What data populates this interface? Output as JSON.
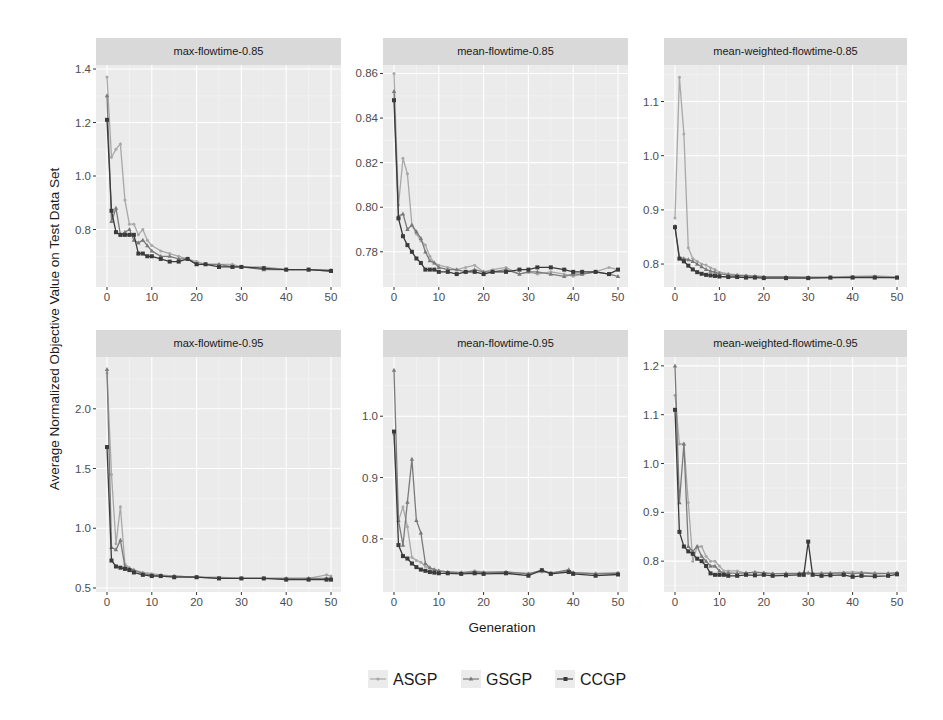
{
  "figure": {
    "ylabel": "Average Normalized Objective Value on Test Data Set",
    "xlabel": "Generation"
  },
  "legend": {
    "items": [
      {
        "label": "ASGP",
        "color": "#a8a8a8",
        "marker": "dot"
      },
      {
        "label": "GSGP",
        "color": "#7a7a7a",
        "marker": "triangle"
      },
      {
        "label": "CCGP",
        "color": "#3a3a3a",
        "marker": "square"
      }
    ]
  },
  "chart_data": [
    {
      "type": "line",
      "title": "max-flowtime-0.85",
      "xlabel": "Generation",
      "ylabel": "Average Normalized Objective Value on Test Data Set",
      "xlim": [
        0,
        50
      ],
      "ylim": [
        0.6,
        1.4
      ],
      "xticks": [
        0,
        10,
        20,
        30,
        40,
        50
      ],
      "yticks": [
        0.8,
        1.0,
        1.2,
        1.4
      ],
      "grid": true,
      "legend_position": "bottom",
      "x": [
        0,
        1,
        2,
        3,
        4,
        5,
        6,
        7,
        8,
        9,
        10,
        12,
        14,
        16,
        18,
        20,
        22,
        25,
        28,
        30,
        35,
        40,
        45,
        50
      ],
      "series": [
        {
          "name": "ASGP",
          "values": [
            1.37,
            1.07,
            1.1,
            1.12,
            0.91,
            0.82,
            0.82,
            0.78,
            0.8,
            0.76,
            0.74,
            0.72,
            0.71,
            0.7,
            0.69,
            0.68,
            0.67,
            0.67,
            0.67,
            0.66,
            0.66,
            0.65,
            0.65,
            0.65
          ]
        },
        {
          "name": "GSGP",
          "values": [
            1.3,
            0.83,
            0.88,
            0.78,
            0.79,
            0.8,
            0.76,
            0.75,
            0.76,
            0.74,
            0.72,
            0.7,
            0.7,
            0.69,
            0.69,
            0.67,
            0.67,
            0.67,
            0.66,
            0.66,
            0.65,
            0.65,
            0.65,
            0.645
          ]
        },
        {
          "name": "CCGP",
          "values": [
            1.21,
            0.87,
            0.79,
            0.78,
            0.78,
            0.78,
            0.78,
            0.71,
            0.71,
            0.7,
            0.7,
            0.69,
            0.68,
            0.68,
            0.69,
            0.67,
            0.67,
            0.66,
            0.66,
            0.66,
            0.655,
            0.65,
            0.65,
            0.645
          ]
        }
      ]
    },
    {
      "type": "line",
      "title": "mean-flowtime-0.85",
      "xlabel": "Generation",
      "ylabel": "Average Normalized Objective Value on Test Data Set",
      "xlim": [
        0,
        50
      ],
      "ylim": [
        0.766,
        0.862
      ],
      "xticks": [
        0,
        10,
        20,
        30,
        40,
        50
      ],
      "yticks": [
        0.78,
        0.8,
        0.82,
        0.84,
        0.86
      ],
      "grid": true,
      "legend_position": "bottom",
      "x": [
        0,
        1,
        2,
        3,
        4,
        5,
        6,
        7,
        8,
        9,
        10,
        12,
        14,
        16,
        18,
        20,
        22,
        25,
        28,
        30,
        32,
        35,
        38,
        40,
        42,
        45,
        48,
        50
      ],
      "series": [
        {
          "name": "ASGP",
          "values": [
            0.86,
            0.801,
            0.822,
            0.815,
            0.792,
            0.788,
            0.785,
            0.783,
            0.778,
            0.775,
            0.774,
            0.773,
            0.772,
            0.773,
            0.774,
            0.771,
            0.772,
            0.773,
            0.77,
            0.771,
            0.77,
            0.771,
            0.77,
            0.769,
            0.77,
            0.771,
            0.773,
            0.772
          ]
        },
        {
          "name": "GSGP",
          "values": [
            0.852,
            0.796,
            0.797,
            0.79,
            0.792,
            0.789,
            0.786,
            0.78,
            0.776,
            0.775,
            0.773,
            0.772,
            0.772,
            0.771,
            0.772,
            0.771,
            0.771,
            0.772,
            0.77,
            0.771,
            0.771,
            0.77,
            0.769,
            0.77,
            0.77,
            0.771,
            0.77,
            0.769
          ]
        },
        {
          "name": "CCGP",
          "values": [
            0.848,
            0.795,
            0.787,
            0.783,
            0.78,
            0.777,
            0.775,
            0.772,
            0.772,
            0.772,
            0.771,
            0.771,
            0.77,
            0.771,
            0.771,
            0.77,
            0.771,
            0.771,
            0.772,
            0.772,
            0.773,
            0.773,
            0.772,
            0.771,
            0.771,
            0.771,
            0.77,
            0.772
          ]
        }
      ]
    },
    {
      "type": "line",
      "title": "mean-weighted-flowtime-0.85",
      "xlabel": "Generation",
      "ylabel": "Average Normalized Objective Value on Test Data Set",
      "xlim": [
        0,
        50
      ],
      "ylim": [
        0.765,
        1.16
      ],
      "xticks": [
        0,
        10,
        20,
        30,
        40,
        50
      ],
      "yticks": [
        0.8,
        0.9,
        1.0,
        1.1
      ],
      "grid": true,
      "legend_position": "bottom",
      "x": [
        0,
        1,
        2,
        3,
        4,
        5,
        6,
        7,
        8,
        9,
        10,
        12,
        14,
        16,
        18,
        20,
        25,
        30,
        35,
        40,
        45,
        50
      ],
      "series": [
        {
          "name": "ASGP",
          "values": [
            0.885,
            1.145,
            1.04,
            0.83,
            0.81,
            0.805,
            0.8,
            0.798,
            0.793,
            0.79,
            0.785,
            0.782,
            0.78,
            0.779,
            0.778,
            0.777,
            0.776,
            0.776,
            0.776,
            0.777,
            0.778,
            0.776
          ]
        },
        {
          "name": "GSGP",
          "values": [
            0.87,
            0.812,
            0.81,
            0.808,
            0.805,
            0.8,
            0.795,
            0.79,
            0.787,
            0.785,
            0.782,
            0.78,
            0.779,
            0.778,
            0.777,
            0.776,
            0.776,
            0.775,
            0.775,
            0.776,
            0.776,
            0.775
          ]
        },
        {
          "name": "CCGP",
          "values": [
            0.868,
            0.81,
            0.805,
            0.797,
            0.79,
            0.785,
            0.782,
            0.78,
            0.779,
            0.778,
            0.777,
            0.776,
            0.776,
            0.775,
            0.775,
            0.774,
            0.774,
            0.774,
            0.775,
            0.775,
            0.775,
            0.775
          ]
        }
      ]
    },
    {
      "type": "line",
      "title": "max-flowtime-0.95",
      "xlabel": "Generation",
      "ylabel": "Average Normalized Objective Value on Test Data Set",
      "xlim": [
        0,
        50
      ],
      "ylim": [
        0.5,
        2.4
      ],
      "xticks": [
        0,
        10,
        20,
        30,
        40,
        50
      ],
      "yticks": [
        0.5,
        1.0,
        1.5,
        2.0
      ],
      "grid": true,
      "legend_position": "bottom",
      "x": [
        0,
        1,
        2,
        3,
        4,
        5,
        6,
        8,
        10,
        12,
        15,
        20,
        25,
        30,
        35,
        40,
        45,
        49,
        50
      ],
      "series": [
        {
          "name": "ASGP",
          "values": [
            2.3,
            1.45,
            0.87,
            1.18,
            0.7,
            0.67,
            0.65,
            0.63,
            0.62,
            0.61,
            0.6,
            0.59,
            0.59,
            0.58,
            0.58,
            0.58,
            0.58,
            0.61,
            0.6
          ]
        },
        {
          "name": "GSGP",
          "values": [
            2.33,
            0.84,
            0.82,
            0.9,
            0.68,
            0.66,
            0.65,
            0.62,
            0.61,
            0.6,
            0.6,
            0.59,
            0.58,
            0.58,
            0.58,
            0.58,
            0.58,
            0.58,
            0.58
          ]
        },
        {
          "name": "CCGP",
          "values": [
            1.68,
            0.73,
            0.68,
            0.67,
            0.66,
            0.65,
            0.63,
            0.61,
            0.6,
            0.6,
            0.59,
            0.59,
            0.58,
            0.58,
            0.58,
            0.57,
            0.57,
            0.57,
            0.57
          ]
        }
      ]
    },
    {
      "type": "line",
      "title": "mean-flowtime-0.95",
      "xlabel": "Generation",
      "ylabel": "Average Normalized Objective Value on Test Data Set",
      "xlim": [
        0,
        50
      ],
      "ylim": [
        0.72,
        1.09
      ],
      "xticks": [
        0,
        10,
        20,
        30,
        40,
        50
      ],
      "yticks": [
        0.8,
        0.9,
        1.0
      ],
      "grid": true,
      "legend_position": "bottom",
      "x": [
        0,
        1,
        2,
        3,
        4,
        5,
        6,
        7,
        8,
        9,
        10,
        12,
        15,
        18,
        20,
        25,
        30,
        33,
        35,
        39,
        40,
        45,
        50
      ],
      "series": [
        {
          "name": "ASGP",
          "values": [
            0.97,
            0.83,
            0.852,
            0.82,
            0.77,
            0.765,
            0.762,
            0.755,
            0.752,
            0.75,
            0.748,
            0.746,
            0.745,
            0.748,
            0.746,
            0.746,
            0.744,
            0.746,
            0.745,
            0.748,
            0.745,
            0.744,
            0.745
          ]
        },
        {
          "name": "GSGP",
          "values": [
            1.075,
            0.83,
            0.79,
            0.86,
            0.93,
            0.83,
            0.81,
            0.76,
            0.753,
            0.75,
            0.748,
            0.746,
            0.745,
            0.746,
            0.745,
            0.746,
            0.743,
            0.749,
            0.744,
            0.75,
            0.745,
            0.743,
            0.744
          ]
        },
        {
          "name": "CCGP",
          "values": [
            0.975,
            0.79,
            0.772,
            0.768,
            0.76,
            0.754,
            0.75,
            0.748,
            0.746,
            0.745,
            0.744,
            0.744,
            0.743,
            0.744,
            0.743,
            0.744,
            0.74,
            0.749,
            0.743,
            0.746,
            0.743,
            0.74,
            0.742
          ]
        }
      ]
    },
    {
      "type": "line",
      "title": "mean-weighted-flowtime-0.95",
      "xlabel": "Generation",
      "ylabel": "Average Normalized Objective Value on Test Data Set",
      "xlim": [
        0,
        50
      ],
      "ylim": [
        0.745,
        1.21
      ],
      "xticks": [
        0,
        10,
        20,
        30,
        40,
        50
      ],
      "yticks": [
        0.8,
        0.9,
        1.0,
        1.1,
        1.2
      ],
      "grid": true,
      "legend_position": "bottom",
      "annotations": [
        "CCGP spike at generation 30 (~0.84)"
      ],
      "x": [
        0,
        1,
        2,
        3,
        4,
        5,
        6,
        7,
        8,
        9,
        10,
        11,
        12,
        14,
        16,
        18,
        20,
        22,
        25,
        28,
        29,
        30,
        31,
        33,
        35,
        38,
        40,
        42,
        45,
        48,
        50
      ],
      "series": [
        {
          "name": "ASGP",
          "values": [
            1.14,
            1.04,
            1.04,
            0.92,
            0.8,
            0.83,
            0.83,
            0.81,
            0.8,
            0.8,
            0.79,
            0.78,
            0.78,
            0.78,
            0.775,
            0.778,
            0.776,
            0.775,
            0.774,
            0.775,
            0.776,
            0.775,
            0.775,
            0.776,
            0.776,
            0.777,
            0.778,
            0.777,
            0.776,
            0.775,
            0.776
          ]
        },
        {
          "name": "GSGP",
          "values": [
            1.2,
            0.92,
            1.04,
            0.83,
            0.82,
            0.83,
            0.81,
            0.8,
            0.79,
            0.79,
            0.78,
            0.775,
            0.776,
            0.775,
            0.776,
            0.777,
            0.776,
            0.774,
            0.775,
            0.775,
            0.776,
            0.776,
            0.775,
            0.774,
            0.775,
            0.776,
            0.774,
            0.776,
            0.774,
            0.775,
            0.776
          ]
        },
        {
          "name": "CCGP",
          "values": [
            1.11,
            0.86,
            0.83,
            0.82,
            0.815,
            0.805,
            0.8,
            0.79,
            0.775,
            0.772,
            0.772,
            0.772,
            0.77,
            0.77,
            0.772,
            0.771,
            0.772,
            0.77,
            0.771,
            0.772,
            0.772,
            0.84,
            0.772,
            0.77,
            0.771,
            0.772,
            0.768,
            0.77,
            0.769,
            0.77,
            0.773
          ]
        }
      ]
    }
  ]
}
